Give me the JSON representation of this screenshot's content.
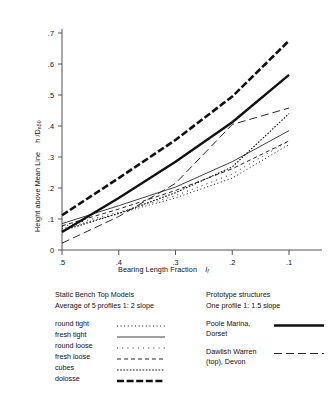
{
  "chart_data": {
    "type": "line",
    "title": "",
    "xlabel": "Bearing Length Fraction  I_f",
    "xlabel_main": "Bearing Length Fraction",
    "xlabel_symbol": "I",
    "xlabel_symbol_sub": "f",
    "ylabel_main": "Height above Mean Line",
    "ylabel_symbol": "h /D",
    "ylabel_symbol_sub": "n50",
    "xlim": [
      0.5,
      0.1
    ],
    "ylim": [
      0,
      0.7
    ],
    "x_ticks": [
      ".5",
      ".4",
      ".3",
      ".2",
      ".1"
    ],
    "x_tick_values": [
      0.5,
      0.4,
      0.3,
      0.2,
      0.1
    ],
    "y_ticks": [
      "0",
      ".1",
      ".2",
      ".3",
      ".4",
      ".5",
      ".6",
      ".7"
    ],
    "y_tick_values": [
      0,
      0.1,
      0.2,
      0.3,
      0.4,
      0.5,
      0.6,
      0.7
    ],
    "grid": false,
    "legend_position": "below-plot",
    "series": [
      {
        "name": "round tight",
        "style": "fine-dotted",
        "x": [
          0.5,
          0.4,
          0.3,
          0.2,
          0.1
        ],
        "values": [
          0.068,
          0.118,
          0.168,
          0.232,
          0.34
        ]
      },
      {
        "name": "fresh tight",
        "style": "thin-solid",
        "x": [
          0.5,
          0.4,
          0.3,
          0.2,
          0.1
        ],
        "values": [
          0.085,
          0.143,
          0.203,
          0.285,
          0.385
        ]
      },
      {
        "name": "round loose",
        "style": "sparse-dotted",
        "x": [
          0.5,
          0.4,
          0.3,
          0.2,
          0.1
        ],
        "values": [
          0.075,
          0.122,
          0.175,
          0.245,
          0.352
        ]
      },
      {
        "name": "fresh loose",
        "style": "medium-dashed",
        "x": [
          0.5,
          0.4,
          0.3,
          0.2,
          0.1
        ],
        "values": [
          0.078,
          0.132,
          0.192,
          0.262,
          0.352
        ]
      },
      {
        "name": "cubes",
        "style": "dash-dot-fine",
        "x": [
          0.5,
          0.4,
          0.3,
          0.2,
          0.1
        ],
        "values": [
          0.062,
          0.118,
          0.185,
          0.268,
          0.44
        ]
      },
      {
        "name": "dolosse",
        "style": "thick-dashed",
        "x": [
          0.5,
          0.4,
          0.3,
          0.2,
          0.1
        ],
        "values": [
          0.112,
          0.232,
          0.355,
          0.495,
          0.675
        ]
      },
      {
        "name": "Poole Marina, Dorset",
        "style": "thick-solid",
        "x": [
          0.5,
          0.4,
          0.3,
          0.2,
          0.1
        ],
        "values": [
          0.058,
          0.168,
          0.285,
          0.412,
          0.565
        ]
      },
      {
        "name": "Dawlish Warren (top), Devon",
        "style": "long-dashed",
        "x": [
          0.5,
          0.4,
          0.3,
          0.2,
          0.1
        ],
        "values": [
          0.022,
          0.108,
          0.215,
          0.405,
          0.458
        ]
      }
    ]
  },
  "legend": {
    "left": {
      "heading": "Static Bench Top Models",
      "subheading": "Average of 5 profiles  1: 2 slope",
      "items": [
        {
          "label": "round tight",
          "style": "fine-dotted"
        },
        {
          "label": "fresh tight",
          "style": "thin-solid"
        },
        {
          "label": "round loose",
          "style": "sparse-dotted"
        },
        {
          "label": "fresh loose",
          "style": "medium-dashed"
        },
        {
          "label": "cubes",
          "style": "dash-dot-fine"
        },
        {
          "label": "dolosse",
          "style": "thick-dashed"
        }
      ]
    },
    "right": {
      "heading": "Prototype structures",
      "subheading": "One profile 1: 1.5 slope",
      "items": [
        {
          "line1": "Poole Marina,",
          "line2": "Dorset",
          "style": "thick-solid"
        },
        {
          "line1": "Dawlish Warren",
          "line2": "(top),  Devon",
          "style": "long-dashed"
        }
      ]
    }
  },
  "colors": {
    "ink": "#111111",
    "axis": "#555555",
    "background": "#ffffff"
  }
}
